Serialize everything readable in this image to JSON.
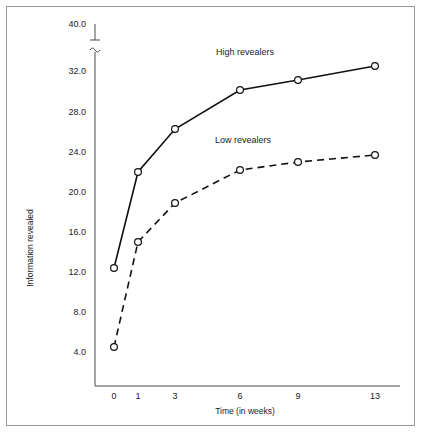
{
  "chart_data": {
    "type": "line",
    "title": "",
    "xlabel": "Time (in weeks)",
    "ylabel": "Information revealed",
    "x": [
      0,
      1,
      3,
      6,
      9,
      13
    ],
    "categories": [
      "0",
      "1",
      "3",
      "6",
      "9",
      "13"
    ],
    "xtick_labels": [
      "0",
      "1",
      "3",
      "6",
      "9",
      "13"
    ],
    "ytick_labels": [
      "4.0",
      "8.0",
      "12.0",
      "16.0",
      "20.0",
      "24.0",
      "28.0",
      "32.0",
      "40.0"
    ],
    "ytick_values": [
      4.0,
      8.0,
      12.0,
      16.0,
      20.0,
      24.0,
      28.0,
      32.0,
      40.0
    ],
    "ylim": [
      2.0,
      40.0
    ],
    "axis_break": true,
    "axis_break_between": [
      32.0,
      40.0
    ],
    "grid": false,
    "legend_position": "inline-annotations",
    "series": [
      {
        "name": "High revealers",
        "style": "solid",
        "marker": "open-circle",
        "values": [
          12.4,
          22.0,
          26.3,
          30.2,
          31.2,
          32.6
        ]
      },
      {
        "name": "Low revealers",
        "style": "dashed",
        "marker": "open-circle",
        "values": [
          4.5,
          15.0,
          18.9,
          22.2,
          23.0,
          23.7
        ]
      }
    ],
    "annotations": [
      {
        "text": "High revealers",
        "x": 6,
        "y": 34.5
      },
      {
        "text": "Low revealers",
        "x": 6,
        "y": 25.8
      }
    ]
  }
}
